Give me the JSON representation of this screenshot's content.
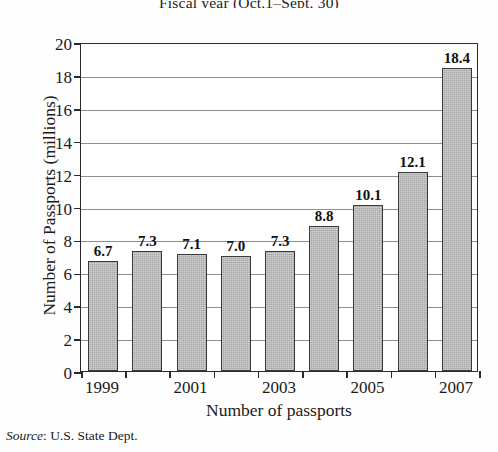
{
  "chart_data": {
    "type": "bar",
    "title": "Fiscal year (Oct.1–Sept. 30)",
    "xlabel": "Number of passports",
    "ylabel": "Number of Passports (millions)",
    "categories": [
      "1999",
      "2000",
      "2001",
      "2002",
      "2003",
      "2004",
      "2005",
      "2006",
      "2007"
    ],
    "values": [
      6.7,
      7.3,
      7.1,
      7.0,
      7.3,
      8.8,
      10.1,
      12.1,
      18.4
    ],
    "value_labels": [
      "6.7",
      "7.3",
      "7.1",
      "7.0",
      "7.3",
      "8.8",
      "10.1",
      "12.1",
      "18.4"
    ],
    "tick_labels_x": [
      "1999",
      "2001",
      "2003",
      "2005",
      "2007"
    ],
    "tick_label_x_indices": [
      0,
      2,
      4,
      6,
      8
    ],
    "ylim": [
      0,
      20
    ],
    "yticks": [
      0,
      2,
      4,
      6,
      8,
      10,
      12,
      14,
      16,
      18,
      20
    ],
    "ytick_labels": [
      "0",
      "2",
      "4",
      "6",
      "8",
      "10",
      "12",
      "14",
      "16",
      "18",
      "20"
    ],
    "grid": true,
    "legend": false,
    "bar_color": "#a8a8a8",
    "bar_edge_color": "#3a3a3a",
    "grid_color": "#8e8e8e",
    "axis_color": "#2a2a2a"
  },
  "source": {
    "label": "Source",
    "separator": ": ",
    "text": "U.S. State Dept."
  }
}
